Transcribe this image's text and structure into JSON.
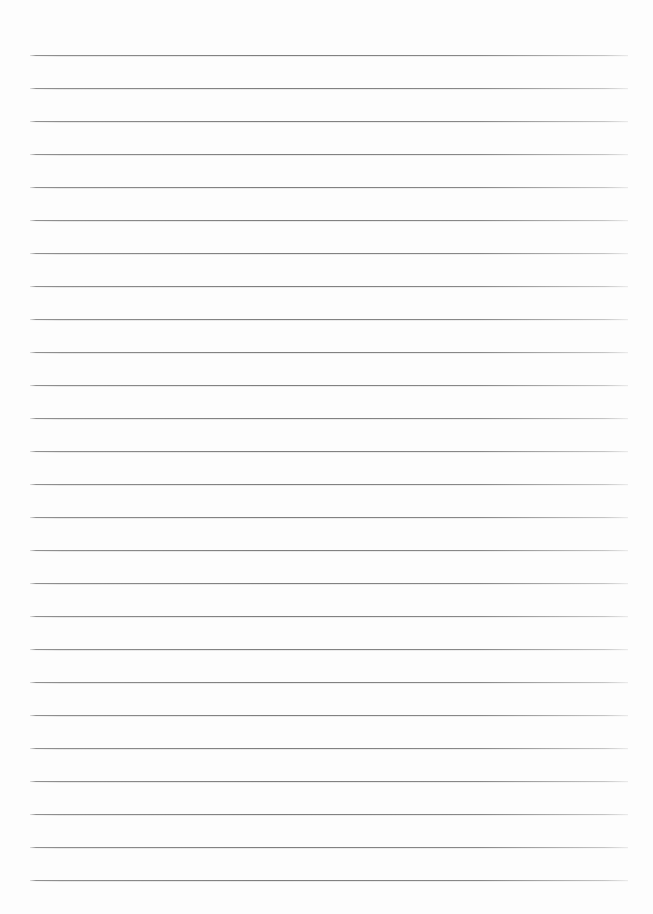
{
  "document": {
    "type": "lined-paper",
    "title": "Blank ruled notebook page",
    "content_text": "",
    "is_blank": true,
    "page_width": 653,
    "page_height": 914,
    "background_color": "#fdfdfd",
    "orientation": "portrait"
  },
  "ruling": {
    "line_color": "#7e7e7e",
    "line_color_faint": "#c6c6c6",
    "line_thickness": 1,
    "line_count": 26,
    "line_spacing": 33,
    "first_line_y": 55,
    "last_line_y": 880,
    "line_left_x": 30,
    "line_right_x": 628,
    "line_width": 598,
    "lines_y": [
      55,
      88,
      121,
      154,
      187,
      220,
      253,
      286,
      319,
      352,
      385,
      418,
      451,
      484,
      517,
      550,
      583,
      616,
      649,
      682,
      715,
      748,
      781,
      814,
      847,
      880
    ]
  },
  "margins": {
    "top": 55,
    "bottom": 33,
    "left": 30,
    "right": 25,
    "has_vertical_margin_rule": false
  },
  "annotations": {
    "has_text": false,
    "has_header": false,
    "has_page_number": false,
    "has_holes": false,
    "text_lines": []
  }
}
